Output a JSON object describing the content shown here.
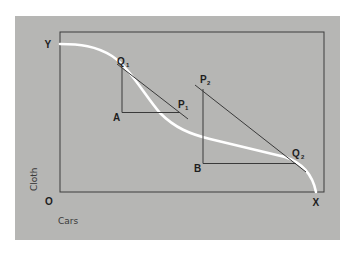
{
  "diagram": {
    "axes": {
      "y_axis_title": "Cloth",
      "x_axis_title": "Cars",
      "origin_label": "O",
      "y_intercept_label": "Y",
      "x_intercept_label": "X"
    },
    "points": {
      "q1": {
        "main": "Q",
        "sub": "1"
      },
      "p1": {
        "main": "P",
        "sub": "1"
      },
      "a": {
        "main": "A"
      },
      "p2": {
        "main": "P",
        "sub": "2"
      },
      "q2": {
        "main": "Q",
        "sub": "2"
      },
      "b": {
        "main": "B"
      }
    },
    "colors": {
      "panel": "#b6b6b4",
      "frame": "#3c3c3c",
      "curve": "#ffffff",
      "lines": "#3a3a3a",
      "labels": "#1e1e1e"
    }
  }
}
